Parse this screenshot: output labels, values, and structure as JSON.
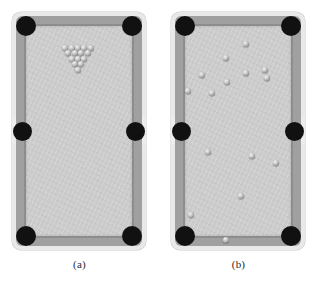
{
  "figure": {
    "type": "illustration",
    "background_color": "#ffffff",
    "panel_count": 2
  },
  "palette": {
    "frame": "#e9e9e9",
    "rail": "#a0a0a0",
    "cushion": "#8d8d8d",
    "cloth": "#cccccc",
    "pocket": "#111111",
    "ball_light": "#f2f2f2",
    "ball_dark": "#565656",
    "caption_text": "#2b2b2b"
  },
  "table": {
    "width": 134,
    "height": 238,
    "pockets": [
      {
        "name": "pocket-top-left",
        "kind": "corner"
      },
      {
        "name": "pocket-top-right",
        "kind": "corner"
      },
      {
        "name": "pocket-middle-left",
        "kind": "side"
      },
      {
        "name": "pocket-middle-right",
        "kind": "side"
      },
      {
        "name": "pocket-bottom-left",
        "kind": "corner"
      },
      {
        "name": "pocket-bottom-right",
        "kind": "corner"
      }
    ],
    "pocket_count": 6
  },
  "panels": [
    {
      "id": "a",
      "caption": "(a)",
      "state": "racked",
      "ball_count": 15,
      "ball_diameter": 6.2,
      "rack": {
        "shape": "triangle",
        "apex": "bottom",
        "rows": [
          5,
          4,
          3,
          2,
          1
        ],
        "apex_x": 78,
        "top_row_y": 48,
        "row_spacing": 5.4,
        "ball_spacing": 6.4
      },
      "balls": [
        {
          "x": 65.2,
          "y": 48.0
        },
        {
          "x": 71.6,
          "y": 48.0
        },
        {
          "x": 78.0,
          "y": 48.0
        },
        {
          "x": 84.4,
          "y": 48.0
        },
        {
          "x": 90.8,
          "y": 48.0
        },
        {
          "x": 68.4,
          "y": 53.4
        },
        {
          "x": 74.8,
          "y": 53.4
        },
        {
          "x": 81.2,
          "y": 53.4
        },
        {
          "x": 87.6,
          "y": 53.4
        },
        {
          "x": 71.6,
          "y": 58.8
        },
        {
          "x": 78.0,
          "y": 58.8
        },
        {
          "x": 84.4,
          "y": 58.8
        },
        {
          "x": 74.8,
          "y": 64.2
        },
        {
          "x": 81.2,
          "y": 64.2
        },
        {
          "x": 78.0,
          "y": 69.6
        }
      ]
    },
    {
      "id": "b",
      "caption": "(b)",
      "state": "scattered",
      "ball_count": 15,
      "ball_diameter": 6.2,
      "balls": [
        {
          "x": 247.0,
          "y": 44.0
        },
        {
          "x": 227.0,
          "y": 58.0
        },
        {
          "x": 203.0,
          "y": 75.0
        },
        {
          "x": 228.0,
          "y": 82.0
        },
        {
          "x": 247.0,
          "y": 73.0
        },
        {
          "x": 266.0,
          "y": 70.0
        },
        {
          "x": 268.0,
          "y": 78.0
        },
        {
          "x": 189.0,
          "y": 91.0
        },
        {
          "x": 213.0,
          "y": 93.0
        },
        {
          "x": 209.0,
          "y": 152.0
        },
        {
          "x": 253.0,
          "y": 156.0
        },
        {
          "x": 277.0,
          "y": 163.0
        },
        {
          "x": 242.0,
          "y": 196.0
        },
        {
          "x": 192.0,
          "y": 215.0
        },
        {
          "x": 227.0,
          "y": 240.0
        }
      ]
    }
  ]
}
